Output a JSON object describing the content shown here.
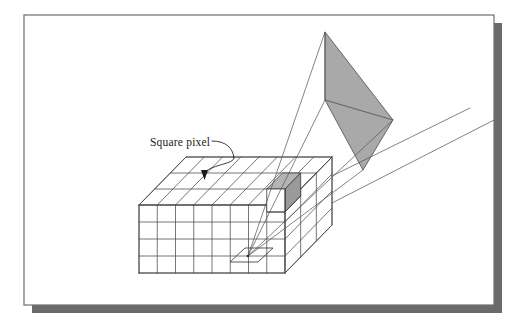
{
  "figure": {
    "kind": "technical-line-diagram",
    "background_color": "#ffffff",
    "frame": {
      "border_color": "#6e6e6e",
      "fill_color": "#ffffff",
      "shadow_color": "#6a6a6a",
      "x": 24,
      "y": 15,
      "width": 470,
      "height": 290,
      "shadow_offset": 8
    },
    "annotation": {
      "label": "Square pixel",
      "label_x": 150,
      "label_y": 146,
      "leader_color": "#1a1a1a",
      "arrow_tip_x": 204,
      "arrow_tip_y": 179
    },
    "voxel_box": {
      "front_cols": 8,
      "front_rows": 4,
      "depth_layers": 3,
      "line_color": "#4a4a4a",
      "face_fill": "#ffffff",
      "front_left_x": 139,
      "front_top_y": 205,
      "front_right_x": 285,
      "front_bottom_y": 273,
      "depth_dx": 47,
      "depth_dy": -48
    },
    "highlighted_voxel": {
      "fill_color": "#b4b4b4",
      "shade_color": "#9a9a9a",
      "edge_color": "#3a3a3a",
      "position_note": "upper-right cell on box top surface"
    },
    "view_plane": {
      "shape": "kite",
      "fill_color": "#a9a9a9",
      "edge_color": "#5a5a5a",
      "apex_x": 325,
      "apex_y": 32,
      "left_x": 325,
      "left_y": 100,
      "right_x": 393,
      "right_y": 120,
      "bottom_x": 363,
      "bottom_y": 170
    },
    "eye_point": {
      "x": 248,
      "y": 256,
      "marker": "small parallelogram footprint"
    },
    "rays": {
      "color": "#5a5a5a",
      "count": 4,
      "description": "projection rays from eye point through the view plane"
    }
  }
}
